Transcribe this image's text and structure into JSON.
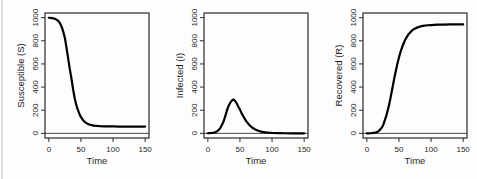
{
  "figure": {
    "name": "SIR epidemic model output",
    "background": "#fdfdfd",
    "curve_color": "#000000",
    "box_color": "#2a2a2a",
    "text_color": "#1f1f1f",
    "zero_line_color": "#4a4a4a"
  },
  "chart_data": [
    {
      "type": "line",
      "title": "",
      "xlabel": "Time",
      "ylabel": "Susceptible (S)",
      "xlim": [
        0,
        150
      ],
      "ylim": [
        0,
        1000
      ],
      "xticks": [
        0,
        50,
        100,
        150
      ],
      "yticks": [
        0,
        200,
        400,
        600,
        800,
        1000
      ],
      "grid": false,
      "legend": "none",
      "zero_line": true,
      "x": [
        0,
        2.5,
        5,
        7.5,
        10,
        12.5,
        15,
        17.5,
        20,
        22.5,
        25,
        27.5,
        30,
        32.5,
        35,
        37.5,
        40,
        42.5,
        45,
        47.5,
        50,
        52.5,
        55,
        57.5,
        60,
        65,
        70,
        75,
        80,
        85,
        90,
        95,
        100,
        110,
        120,
        130,
        140,
        150
      ],
      "series": [
        {
          "name": "S",
          "values": [
            999,
            998,
            996,
            993,
            989,
            981,
            970,
            950,
            920,
            877,
            824,
            740,
            650,
            560,
            480,
            390,
            310,
            250,
            205,
            170,
            140,
            120,
            104,
            93,
            84,
            73,
            67,
            64,
            62,
            61,
            60,
            60,
            60,
            59,
            59,
            59,
            59,
            59
          ]
        }
      ]
    },
    {
      "type": "line",
      "title": "",
      "xlabel": "Time",
      "ylabel": "Infected (I)",
      "xlim": [
        0,
        150
      ],
      "ylim": [
        0,
        1000
      ],
      "xticks": [
        0,
        50,
        100,
        150
      ],
      "yticks": [
        0,
        200,
        400,
        600,
        800,
        1000
      ],
      "grid": false,
      "legend": "none",
      "zero_line": true,
      "x": [
        0,
        2.5,
        5,
        7.5,
        10,
        12.5,
        15,
        17.5,
        20,
        22.5,
        25,
        27.5,
        30,
        32.5,
        35,
        37.5,
        40,
        42.5,
        45,
        47.5,
        50,
        52.5,
        55,
        57.5,
        60,
        65,
        70,
        75,
        80,
        85,
        90,
        95,
        100,
        110,
        120,
        130,
        140,
        150
      ],
      "series": [
        {
          "name": "I",
          "values": [
            1,
            2,
            3,
            5,
            7,
            12,
            20,
            33,
            52,
            78,
            111,
            155,
            204,
            240,
            265,
            285,
            293,
            280,
            258,
            230,
            205,
            175,
            150,
            126,
            104,
            70,
            46,
            30,
            20,
            13,
            9,
            6,
            4,
            2,
            1,
            0,
            0,
            0
          ]
        }
      ]
    },
    {
      "type": "line",
      "title": "",
      "xlabel": "Time",
      "ylabel": "Recovered (R)",
      "xlim": [
        0,
        150
      ],
      "ylim": [
        0,
        1000
      ],
      "xticks": [
        0,
        50,
        100,
        150
      ],
      "yticks": [
        0,
        200,
        400,
        600,
        800,
        1000
      ],
      "grid": false,
      "legend": "none",
      "zero_line": true,
      "x": [
        0,
        2.5,
        5,
        7.5,
        10,
        12.5,
        15,
        17.5,
        20,
        22.5,
        25,
        27.5,
        30,
        32.5,
        35,
        37.5,
        40,
        42.5,
        45,
        47.5,
        50,
        52.5,
        55,
        57.5,
        60,
        65,
        70,
        75,
        80,
        85,
        90,
        95,
        100,
        110,
        120,
        130,
        140,
        150
      ],
      "series": [
        {
          "name": "R",
          "values": [
            0,
            0,
            1,
            2,
            4,
            7,
            10,
            17,
            28,
            45,
            65,
            105,
            146,
            200,
            255,
            325,
            397,
            470,
            537,
            600,
            655,
            705,
            746,
            781,
            812,
            857,
            887,
            906,
            918,
            926,
            931,
            934,
            936,
            939,
            940,
            941,
            941,
            941
          ]
        }
      ]
    }
  ]
}
